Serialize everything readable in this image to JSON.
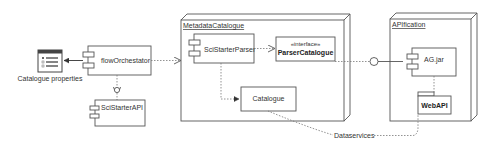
{
  "diagram": {
    "type": "UML component/deployment diagram",
    "nodes": {
      "metadata_catalogue": {
        "label": "MetadataCatalogue"
      },
      "apification": {
        "label": "APIfication"
      }
    },
    "components": {
      "flow_orchestrator": {
        "label": "flowOrchestator"
      },
      "scistarter_api": {
        "label": "SciStarterAPI"
      },
      "scistarter_parser": {
        "label": "SciStarterParser"
      },
      "catalogue": {
        "label": "Catalogue"
      },
      "ag_jar": {
        "label": "AG.jar"
      }
    },
    "interface": {
      "stereotype": "«interface»",
      "label": "ParserCatalogue"
    },
    "package": {
      "label": "WebAPI"
    },
    "artifact": {
      "label": "Catalogue properties",
      "icon": "list-window-icon"
    },
    "connector_label": "Dataservices"
  },
  "colors": {
    "line": "#555555",
    "text": "#333333",
    "background": "#ffffff",
    "icon_fill": "#ffffff",
    "icon_titlebar": "#444444"
  }
}
